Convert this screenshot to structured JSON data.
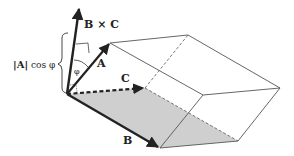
{
  "figure": {
    "labels": {
      "bxc": "B × C",
      "a": "A",
      "b": "B",
      "c": "C",
      "phi": "φ",
      "height_abs": "|A|",
      "height_rest": "cos φ"
    },
    "colors": {
      "ink": "#222222",
      "edge": "#555555",
      "base_fill": "#cfcfcf",
      "background": "#ffffff"
    }
  }
}
